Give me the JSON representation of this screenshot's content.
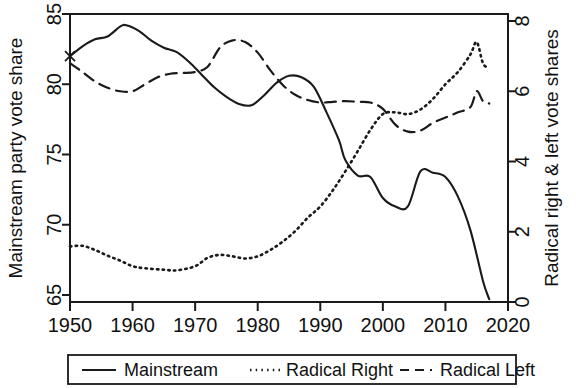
{
  "chart_data": {
    "type": "line",
    "title": "",
    "subtitle": "",
    "xlabel": "",
    "ylabel": "Mainstream party vote share",
    "y2label": "Radical right & left vote shares",
    "xlim": [
      1950,
      2020
    ],
    "ylim": [
      64.5,
      85
    ],
    "y2lim": [
      0,
      8.2
    ],
    "xticks": [
      1950,
      1960,
      1970,
      1980,
      1990,
      2000,
      2010,
      2020
    ],
    "yticks": [
      65,
      70,
      75,
      80,
      85
    ],
    "y2ticks": [
      0,
      2,
      4,
      6,
      8
    ],
    "grid": false,
    "legend_position": "below-outside",
    "series": [
      {
        "name": "Mainstream",
        "axis": "left",
        "style": "solid",
        "color": "#1a1a1a",
        "x": [
          1950,
          1952,
          1954,
          1956,
          1958,
          1959,
          1961,
          1963,
          1965,
          1967,
          1969,
          1971,
          1973,
          1975,
          1977,
          1979,
          1981,
          1983,
          1985,
          1987,
          1989,
          1991,
          1993,
          1994,
          1996,
          1998,
          2000,
          2002,
          2004,
          2006,
          2008,
          2010,
          2012,
          2014,
          2016,
          2017
        ],
        "values": [
          82.0,
          82.7,
          83.2,
          83.4,
          84.1,
          84.2,
          83.8,
          83.1,
          82.6,
          82.3,
          81.6,
          80.7,
          79.8,
          79.1,
          78.6,
          78.5,
          79.2,
          80.1,
          80.6,
          80.5,
          79.8,
          78.0,
          76.0,
          74.6,
          73.5,
          73.4,
          71.9,
          71.3,
          71.3,
          73.8,
          73.7,
          73.4,
          72.0,
          69.6,
          66.0,
          64.7
        ]
      },
      {
        "name": "Radical Right",
        "axis": "right",
        "style": "dotted",
        "color": "#1a1a1a",
        "x": [
          1950,
          1952,
          1954,
          1956,
          1958,
          1960,
          1962,
          1965,
          1967,
          1970,
          1972,
          1974,
          1976,
          1978,
          1980,
          1982,
          1984,
          1986,
          1988,
          1990,
          1992,
          1994,
          1996,
          1998,
          2000,
          2002,
          2004,
          2006,
          2008,
          2010,
          2012,
          2014,
          2015,
          2016,
          2017
        ],
        "values": [
          1.58,
          1.6,
          1.48,
          1.32,
          1.18,
          1.02,
          0.96,
          0.92,
          0.9,
          1.02,
          1.26,
          1.34,
          1.3,
          1.24,
          1.3,
          1.48,
          1.72,
          2.02,
          2.4,
          2.72,
          3.18,
          3.72,
          4.3,
          4.9,
          5.35,
          5.4,
          5.35,
          5.48,
          5.78,
          6.2,
          6.55,
          7.05,
          7.4,
          6.8,
          6.65
        ]
      },
      {
        "name": "Radical Left",
        "axis": "right",
        "style": "dashed",
        "color": "#1a1a1a",
        "x": [
          1950,
          1952,
          1954,
          1956,
          1958,
          1960,
          1962,
          1964,
          1966,
          1968,
          1970,
          1972,
          1974,
          1976,
          1978,
          1980,
          1982,
          1984,
          1986,
          1988,
          1990,
          1992,
          1994,
          1996,
          1998,
          2000,
          2002,
          2004,
          2006,
          2008,
          2010,
          2012,
          2014,
          2015,
          2016,
          2017
        ],
        "values": [
          6.8,
          6.55,
          6.28,
          6.1,
          6.0,
          6.0,
          6.2,
          6.4,
          6.5,
          6.52,
          6.55,
          6.7,
          7.25,
          7.45,
          7.4,
          7.1,
          6.6,
          6.18,
          5.9,
          5.75,
          5.68,
          5.7,
          5.72,
          5.7,
          5.68,
          5.5,
          5.05,
          4.85,
          4.88,
          5.1,
          5.25,
          5.4,
          5.55,
          6.0,
          5.72,
          5.65
        ]
      }
    ],
    "annotations": [
      {
        "name": "start-marker",
        "type": "x-marker",
        "x": 1950,
        "y_left": 82.0,
        "y_right": 6.8
      }
    ]
  },
  "axes": {
    "left": {
      "title": "Mainstream party vote share",
      "tick_labels": [
        "65",
        "70",
        "75",
        "80",
        "85"
      ]
    },
    "right": {
      "title": "Radical right & left vote shares",
      "tick_labels": [
        "0",
        "2",
        "4",
        "6",
        "8"
      ]
    },
    "bottom": {
      "title": "",
      "tick_labels": [
        "1950",
        "1960",
        "1970",
        "1980",
        "1990",
        "2000",
        "2010",
        "2020"
      ]
    }
  },
  "legend": {
    "entries": [
      {
        "label": "Mainstream",
        "style": "solid"
      },
      {
        "label": "Radical Right",
        "style": "dotted"
      },
      {
        "label": "Radical Left",
        "style": "dashed"
      }
    ]
  }
}
